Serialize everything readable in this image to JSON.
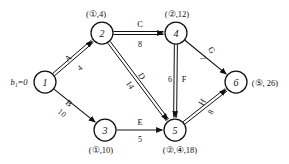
{
  "figure": {
    "type": "shortest-path-network-diagram",
    "source_label": "b₁=0"
  },
  "nodes": [
    {
      "id": "1",
      "x": 45,
      "y": 82,
      "r": 11,
      "tag": "",
      "tag_x": 0,
      "tag_y": 0
    },
    {
      "id": "2",
      "x": 102,
      "y": 33,
      "r": 11,
      "tag": "(①,4)",
      "tag_x": 96,
      "tag_y": 14
    },
    {
      "id": "3",
      "x": 105,
      "y": 130,
      "r": 11,
      "tag": "(①,10)",
      "tag_x": 101,
      "tag_y": 150
    },
    {
      "id": "4",
      "x": 176,
      "y": 33,
      "r": 11,
      "tag": "(②,12)",
      "tag_x": 177,
      "tag_y": 14
    },
    {
      "id": "5",
      "x": 175,
      "y": 130,
      "r": 11,
      "tag": "(②,④,18)",
      "tag_x": 180,
      "tag_y": 150
    },
    {
      "id": "6",
      "x": 236,
      "y": 82,
      "r": 11,
      "tag": "(⑤, 26)",
      "tag_x": 265,
      "tag_y": 83
    }
  ],
  "edges": [
    {
      "name": "A",
      "weight": "4",
      "from": "1",
      "to": "2",
      "style": "double",
      "name_x": 68,
      "name_y": 58,
      "name_rot": -40,
      "wt_x": 80,
      "wt_y": 68,
      "wt_rot": -40
    },
    {
      "name": "B",
      "weight": "10",
      "from": "1",
      "to": "3",
      "style": "single",
      "name_x": 69,
      "name_y": 103,
      "name_rot": 40,
      "wt_x": 62,
      "wt_y": 113,
      "wt_rot": 40
    },
    {
      "name": "C",
      "weight": "8",
      "from": "2",
      "to": "4",
      "style": "double",
      "name_x": 140,
      "name_y": 24,
      "name_rot": 0,
      "wt_x": 140,
      "wt_y": 44,
      "wt_rot": 0
    },
    {
      "name": "D",
      "weight": "14",
      "from": "2",
      "to": "5",
      "style": "double",
      "name_x": 142,
      "name_y": 76,
      "name_rot": 58,
      "wt_x": 130,
      "wt_y": 85,
      "wt_rot": 58
    },
    {
      "name": "E",
      "weight": "5",
      "from": "3",
      "to": "5",
      "style": "single",
      "name_x": 140,
      "name_y": 122,
      "name_rot": 0,
      "wt_x": 140,
      "wt_y": 139,
      "wt_rot": 0
    },
    {
      "name": "F",
      "weight": "6",
      "from": "4",
      "to": "5",
      "style": "double",
      "name_x": 184,
      "name_y": 79,
      "name_rot": 0,
      "wt_x": 170,
      "wt_y": 79,
      "wt_rot": 0
    },
    {
      "name": "G",
      "weight": "7",
      "from": "4",
      "to": "6",
      "style": "single",
      "name_x": 212,
      "name_y": 50,
      "name_rot": 58,
      "wt_x": 203,
      "wt_y": 58,
      "wt_rot": 58
    },
    {
      "name": "H",
      "weight": "8",
      "from": "5",
      "to": "6",
      "style": "double",
      "name_x": 202,
      "name_y": 102,
      "name_rot": -58,
      "wt_x": 211,
      "wt_y": 112,
      "wt_rot": -58
    }
  ],
  "colors": {
    "ink": "#111111",
    "paper": "#ffffff"
  }
}
